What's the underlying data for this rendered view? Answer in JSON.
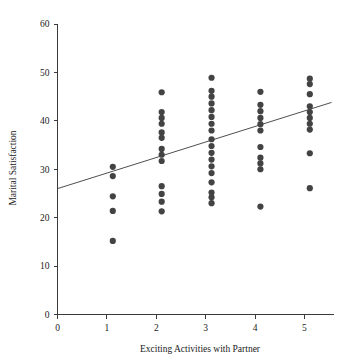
{
  "chart_data": {
    "type": "scatter",
    "title": "",
    "xlabel": "Exciting Activities with Partner",
    "ylabel": "Marital Satisfaction",
    "xlim": [
      0,
      5.6
    ],
    "ylim": [
      0,
      60
    ],
    "xticks": [
      0,
      1,
      2,
      3,
      4,
      5
    ],
    "xtick_labels": [
      "0",
      "1",
      "2",
      "3",
      "4",
      "5"
    ],
    "yticks": [
      0,
      10,
      20,
      30,
      40,
      50,
      60
    ],
    "ytick_labels": [
      "0",
      "10",
      "20",
      "30",
      "40",
      "50",
      "60"
    ],
    "grid": false,
    "legend": "none",
    "marker_color": "#434343",
    "marker_size": 3.1,
    "axis_color": "#3a3a3a",
    "points": [
      {
        "x": 1.12,
        "y": 30.5
      },
      {
        "x": 1.12,
        "y": 28.6
      },
      {
        "x": 1.12,
        "y": 24.4
      },
      {
        "x": 1.12,
        "y": 21.4
      },
      {
        "x": 1.12,
        "y": 15.2
      },
      {
        "x": 2.11,
        "y": 45.9
      },
      {
        "x": 2.11,
        "y": 41.8
      },
      {
        "x": 2.11,
        "y": 40.6
      },
      {
        "x": 2.11,
        "y": 39.4
      },
      {
        "x": 2.11,
        "y": 37.6
      },
      {
        "x": 2.11,
        "y": 36.5
      },
      {
        "x": 2.11,
        "y": 34.2
      },
      {
        "x": 2.11,
        "y": 33.0
      },
      {
        "x": 2.11,
        "y": 31.7
      },
      {
        "x": 2.11,
        "y": 26.5
      },
      {
        "x": 2.11,
        "y": 24.9
      },
      {
        "x": 2.11,
        "y": 23.3
      },
      {
        "x": 2.11,
        "y": 21.3
      },
      {
        "x": 3.12,
        "y": 48.9
      },
      {
        "x": 3.12,
        "y": 46.2
      },
      {
        "x": 3.12,
        "y": 45.0
      },
      {
        "x": 3.12,
        "y": 43.6
      },
      {
        "x": 3.12,
        "y": 42.2
      },
      {
        "x": 3.12,
        "y": 40.8
      },
      {
        "x": 3.12,
        "y": 39.4
      },
      {
        "x": 3.12,
        "y": 38.0
      },
      {
        "x": 3.12,
        "y": 36.2
      },
      {
        "x": 3.12,
        "y": 34.8
      },
      {
        "x": 3.12,
        "y": 33.4
      },
      {
        "x": 3.12,
        "y": 32.0
      },
      {
        "x": 3.12,
        "y": 30.6
      },
      {
        "x": 3.12,
        "y": 29.2
      },
      {
        "x": 3.12,
        "y": 27.3
      },
      {
        "x": 3.12,
        "y": 25.2
      },
      {
        "x": 3.12,
        "y": 24.2
      },
      {
        "x": 3.12,
        "y": 23.0
      },
      {
        "x": 4.11,
        "y": 46.0
      },
      {
        "x": 4.11,
        "y": 43.3
      },
      {
        "x": 4.11,
        "y": 42.0
      },
      {
        "x": 4.11,
        "y": 40.6
      },
      {
        "x": 4.11,
        "y": 39.3
      },
      {
        "x": 4.11,
        "y": 38.0
      },
      {
        "x": 4.11,
        "y": 34.6
      },
      {
        "x": 4.11,
        "y": 32.4
      },
      {
        "x": 4.11,
        "y": 31.2
      },
      {
        "x": 4.11,
        "y": 30.0
      },
      {
        "x": 4.11,
        "y": 22.3
      },
      {
        "x": 5.11,
        "y": 48.7
      },
      {
        "x": 5.11,
        "y": 47.6
      },
      {
        "x": 5.11,
        "y": 45.5
      },
      {
        "x": 5.11,
        "y": 43.0
      },
      {
        "x": 5.11,
        "y": 41.8
      },
      {
        "x": 5.11,
        "y": 40.6
      },
      {
        "x": 5.11,
        "y": 39.4
      },
      {
        "x": 5.11,
        "y": 38.2
      },
      {
        "x": 5.11,
        "y": 33.3
      },
      {
        "x": 5.11,
        "y": 26.1
      }
    ],
    "fit_line": {
      "x_start": 0.0,
      "y_start": 26.0,
      "x_end": 5.55,
      "y_end": 43.8
    }
  }
}
